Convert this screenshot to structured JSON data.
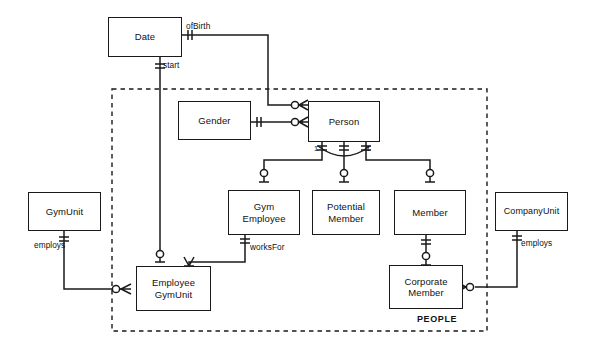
{
  "diagram": {
    "notation": "crow's-foot",
    "line_color": "#1a1a1a",
    "background_color": "#ffffff",
    "canvas": {
      "width": 595,
      "height": 357
    }
  },
  "groups": [
    {
      "id": "people",
      "label": "PEOPLE",
      "style": "dashed",
      "x": 112,
      "y": 89,
      "width": 375,
      "height": 242,
      "label_x": 417,
      "label_y": 314
    }
  ],
  "entities": [
    {
      "id": "date",
      "label": "Date",
      "x": 108,
      "y": 17,
      "width": 74,
      "height": 40
    },
    {
      "id": "gender",
      "label": "Gender",
      "x": 178,
      "y": 101,
      "width": 73,
      "height": 39
    },
    {
      "id": "person",
      "label": "Person",
      "x": 308,
      "y": 101,
      "width": 72,
      "height": 41
    },
    {
      "id": "gym_employee",
      "label": "Gym\nEmployee",
      "x": 228,
      "y": 190,
      "width": 72,
      "height": 45
    },
    {
      "id": "potential_member",
      "label": "Potential\nMember",
      "x": 312,
      "y": 190,
      "width": 68,
      "height": 45
    },
    {
      "id": "member",
      "label": "Member",
      "x": 394,
      "y": 190,
      "width": 72,
      "height": 45
    },
    {
      "id": "gym_unit",
      "label": "GymUnit",
      "x": 28,
      "y": 192,
      "width": 73,
      "height": 39
    },
    {
      "id": "company_unit",
      "label": "CompanyUnit",
      "x": 495,
      "y": 192,
      "width": 73,
      "height": 39
    },
    {
      "id": "employee_gymunit",
      "label": "Employee\nGymUnit",
      "x": 136,
      "y": 266,
      "width": 75,
      "height": 45
    },
    {
      "id": "corporate_member",
      "label": "Corporate\nMember",
      "x": 389,
      "y": 265,
      "width": 74,
      "height": 44
    }
  ],
  "edge_labels": [
    {
      "id": "ofbirth",
      "text": "ofBirth",
      "x": 186,
      "y": 22
    },
    {
      "id": "start",
      "text": "start",
      "x": 163,
      "y": 61
    },
    {
      "id": "worksfor",
      "text": "worksFor",
      "x": 250,
      "y": 243
    },
    {
      "id": "employs-gym",
      "text": "employs",
      "x": 34,
      "y": 241
    },
    {
      "id": "employs-company",
      "text": "employs",
      "x": 521,
      "y": 239
    }
  ],
  "cardinality_labels": [
    {
      "id": "card-left",
      "text": "1",
      "x": 314,
      "y": 145
    },
    {
      "id": "card-right",
      "text": "1",
      "x": 366,
      "y": 145
    }
  ],
  "relationships": [
    {
      "id": "date-ofbirth-person",
      "from": "date",
      "to": "person",
      "label": "ofBirth",
      "from_marker": "one-and-only-one",
      "to_marker": "zero-or-many"
    },
    {
      "id": "gender-person",
      "from": "gender",
      "to": "person",
      "label": "",
      "from_marker": "one-and-only-one",
      "to_marker": "zero-or-many"
    },
    {
      "id": "date-start-empgym",
      "from": "date",
      "to": "employee_gymunit",
      "label": "start",
      "from_marker": "one-and-only-one",
      "to_marker": "zero-or-one"
    },
    {
      "id": "person-gymemployee",
      "from": "person",
      "to": "gym_employee",
      "label": "",
      "from_marker": "one-and-only-one",
      "to_marker": "zero-or-one"
    },
    {
      "id": "person-potential",
      "from": "person",
      "to": "potential_member",
      "label": "",
      "from_marker": "one-and-only-one",
      "to_marker": "zero-or-one"
    },
    {
      "id": "person-member",
      "from": "person",
      "to": "member",
      "label": "",
      "from_marker": "one-and-only-one",
      "to_marker": "zero-or-one"
    },
    {
      "id": "gymemp-worksfor",
      "from": "gym_employee",
      "to": "employee_gymunit",
      "label": "worksFor",
      "from_marker": "one-and-only-one",
      "to_marker": "many"
    },
    {
      "id": "gymunit-employs",
      "from": "gym_unit",
      "to": "employee_gymunit",
      "label": "employs",
      "from_marker": "one-and-only-one",
      "to_marker": "zero-or-many"
    },
    {
      "id": "member-corporate",
      "from": "member",
      "to": "corporate_member",
      "label": "",
      "from_marker": "one-and-only-one",
      "to_marker": "zero-or-one"
    },
    {
      "id": "company-employs",
      "from": "company_unit",
      "to": "corporate_member",
      "label": "employs",
      "from_marker": "one-and-only-one",
      "to_marker": "zero-or-many"
    }
  ]
}
